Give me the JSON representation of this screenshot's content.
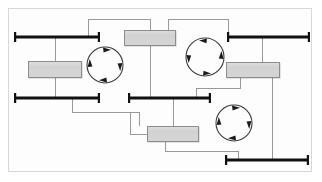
{
  "diagram": {
    "canvas": {
      "width": 322,
      "height": 182
    },
    "colors": {
      "bar": "#111111",
      "connector": "#9a9a9a",
      "task_fill": "#d4d4d4",
      "task_border": "#8d8d8d",
      "loop": "#3a3a3a",
      "frame": "#d8d8d8",
      "background": "#ffffff"
    },
    "bars": [
      {
        "name": "gateway-bar-top-left",
        "label": "",
        "x1": 14,
        "x2": 100,
        "y": 37
      },
      {
        "name": "gateway-bar-top-right",
        "label": "",
        "x1": 227,
        "x2": 310,
        "y": 37
      },
      {
        "name": "gateway-bar-middle-left",
        "label": "",
        "x1": 14,
        "x2": 100,
        "y": 98
      },
      {
        "name": "gateway-bar-middle-right",
        "label": "",
        "x1": 128,
        "x2": 211,
        "y": 98
      },
      {
        "name": "gateway-bar-bottom",
        "label": "",
        "x1": 225,
        "x2": 309,
        "y": 160
      }
    ],
    "tasks": [
      {
        "name": "task-box-left",
        "label": "",
        "x": 28,
        "y": 61,
        "w": 54,
        "h": 17
      },
      {
        "name": "task-box-top-center",
        "label": "",
        "x": 124,
        "y": 30,
        "w": 52,
        "h": 16
      },
      {
        "name": "task-box-right",
        "label": "",
        "x": 226,
        "y": 62,
        "w": 54,
        "h": 16
      },
      {
        "name": "task-box-bottom-center",
        "label": "",
        "x": 147,
        "y": 126,
        "w": 52,
        "h": 16
      }
    ],
    "loops": [
      {
        "name": "loop-cycle-left",
        "cx": 105,
        "cy": 65,
        "r": 18,
        "direction": "clockwise"
      },
      {
        "name": "loop-cycle-top-right",
        "cx": 205,
        "cy": 57,
        "r": 19,
        "direction": "counter-clockwise"
      },
      {
        "name": "loop-cycle-bottom",
        "cx": 234,
        "cy": 123,
        "r": 18,
        "direction": "clockwise"
      }
    ],
    "connector_count": 12
  }
}
